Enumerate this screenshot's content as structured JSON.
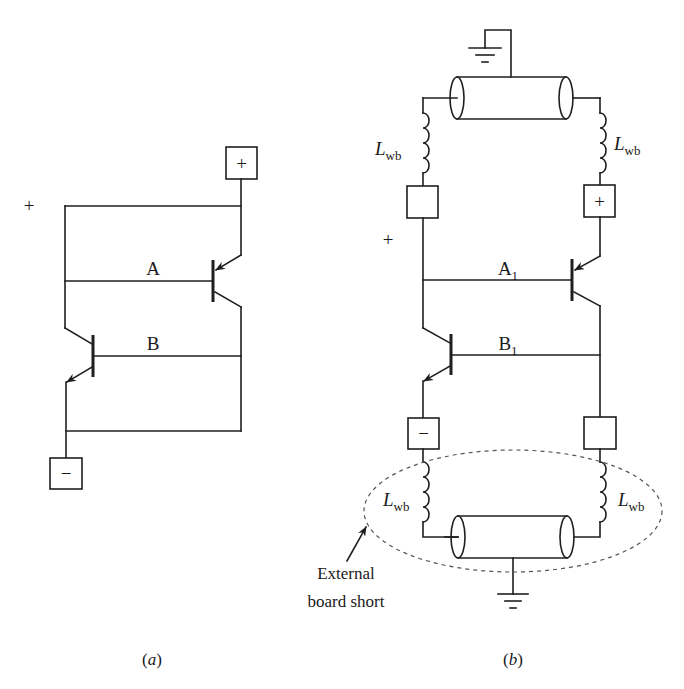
{
  "figure": {
    "panel_a": {
      "caption": "(a)",
      "caption_letter": "a",
      "plus_label": "+",
      "terminal_plus": "+",
      "terminal_minus": "−",
      "node_A": "A",
      "node_B": "B"
    },
    "panel_b": {
      "caption": "(b)",
      "caption_letter": "b",
      "plus_label": "+",
      "terminal_top_right": "+",
      "terminal_bottom_left": "−",
      "node_A": "A",
      "node_A_sub": "1",
      "node_B": "B",
      "node_B_sub": "1",
      "inductor_label": "L",
      "inductor_sub": "wb",
      "annotation_line1": "External",
      "annotation_line2": "board short"
    },
    "colors": {
      "line": "#1f1f1f",
      "dashed": "#555555",
      "background": "#ffffff"
    }
  }
}
